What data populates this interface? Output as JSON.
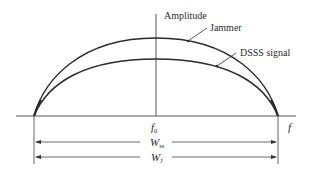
{
  "diagram": {
    "type": "spectrum-comparison",
    "axis_labels": {
      "vertical": "Amplitude",
      "horizontal": "f"
    },
    "center_frequency": {
      "symbol": "f",
      "subscript": "0"
    },
    "curves": [
      {
        "name": "Jammer",
        "label": "Jammer",
        "relative_peak": 1.0,
        "color": "#2a2a2a"
      },
      {
        "name": "DSSS signal",
        "label": "DSSS signal",
        "relative_peak": 0.73,
        "color": "#2a2a2a"
      }
    ],
    "bandwidths": [
      {
        "symbol": "W",
        "subscript": "ss",
        "description": "spread-spectrum bandwidth"
      },
      {
        "symbol": "W",
        "subscript": "J",
        "description": "jammer bandwidth"
      }
    ],
    "colors": {
      "line": "#2a2a2a",
      "background": "#ffffff"
    }
  }
}
